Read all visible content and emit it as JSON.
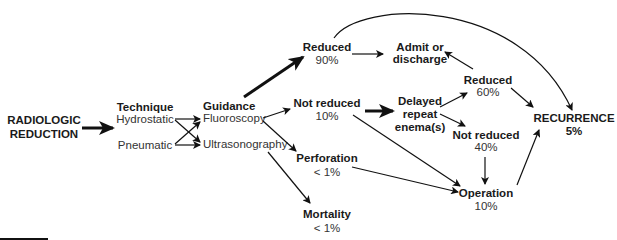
{
  "diagram": {
    "start": {
      "line1": "RADIOLOGIC",
      "line2": "REDUCTION"
    },
    "technique": {
      "title": "Technique",
      "options": [
        "Hydrostatic",
        "Pneumatic"
      ]
    },
    "guidance": {
      "title": "Guidance",
      "options": [
        "Fluoroscopy",
        "Ultrasonography"
      ]
    },
    "reduced": {
      "label": "Reduced",
      "value": "90%"
    },
    "admit": {
      "line1": "Admit or",
      "line2": "discharge"
    },
    "not_reduced": {
      "label": "Not reduced",
      "value": "10%"
    },
    "delayed": {
      "line1": "Delayed",
      "line2": "repeat",
      "line3": "enema(s)"
    },
    "reduced2": {
      "label": "Reduced",
      "value": "60%"
    },
    "not_reduced2": {
      "label": "Not reduced",
      "value": "40%"
    },
    "perforation": {
      "label": "Perforation",
      "value": "< 1%"
    },
    "operation": {
      "label": "Operation",
      "value": "10%"
    },
    "mortality": {
      "label": "Mortality",
      "value": "< 1%"
    },
    "recurrence": {
      "label": "RECURRENCE",
      "value": "5%"
    }
  }
}
